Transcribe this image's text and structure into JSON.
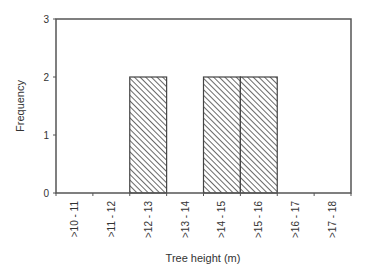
{
  "chart_data": {
    "type": "bar",
    "title": "",
    "xlabel": "Tree height (m)",
    "ylabel": "Frequency",
    "categories": [
      ">10 - 11",
      ">11 - 12",
      ">12 - 13",
      ">13 - 14",
      ">14 - 15",
      ">15 - 16",
      ">16 - 17",
      ">17 - 18"
    ],
    "values": [
      0,
      0,
      2,
      0,
      2,
      2,
      0,
      0
    ],
    "ylim": [
      0,
      3
    ],
    "yticks": [
      0,
      1,
      2,
      3
    ],
    "grid": false,
    "legend": null,
    "bar_fill": "diagonal-hatch",
    "colors": {
      "axis": "#555555",
      "bar_edge": "#444444",
      "hatch": "#444444",
      "text": "#333333"
    }
  }
}
